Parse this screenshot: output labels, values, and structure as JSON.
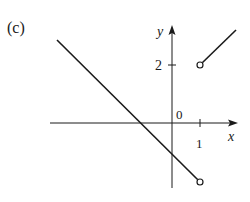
{
  "figure": {
    "label": "(c)",
    "axes": {
      "x_label": "x",
      "y_label": "y",
      "origin_label": "0",
      "x_ticks": [
        {
          "value": 1,
          "label": "1"
        }
      ],
      "y_ticks": [
        {
          "value": 2,
          "label": "2"
        }
      ]
    },
    "pieces": [
      {
        "name": "left-segment",
        "description": "line with negative slope",
        "start": {
          "x": -4.1,
          "y": 2.85
        },
        "end": {
          "x": 1,
          "y": -2.05
        },
        "end_marker": "open-circle"
      },
      {
        "name": "right-segment",
        "description": "line with positive slope",
        "start": {
          "x": 1,
          "y": 2
        },
        "end": {
          "x": 2.25,
          "y": 3.2
        },
        "start_marker": "open-circle"
      }
    ],
    "colors": {
      "line": "#1a1a1a",
      "background": "#ffffff"
    }
  }
}
